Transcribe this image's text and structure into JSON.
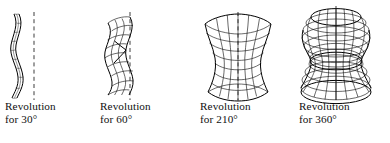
{
  "figure": {
    "kind": "surface-of-revolution-sequence",
    "background": "#ffffff",
    "ink": "#000000",
    "width": 390,
    "height": 143
  },
  "panels": [
    {
      "id": "rev-30",
      "angle_deg": 30,
      "caption_line1": "Revolution",
      "caption_line2": "for 30°",
      "axis": {
        "style": "dashed",
        "visible": true
      },
      "surface": {
        "style": "thin-ribbon",
        "mesh_rings": 9,
        "mesh_meridians": 3
      }
    },
    {
      "id": "rev-60",
      "angle_deg": 60,
      "caption_line1": "Revolution",
      "caption_line2": "for 60°",
      "axis": {
        "style": "dashed",
        "visible": true
      },
      "surface": {
        "style": "narrow-band",
        "mesh_rings": 9,
        "mesh_meridians": 5
      }
    },
    {
      "id": "rev-210",
      "angle_deg": 210,
      "caption_line1": "Revolution",
      "caption_line2": "for 210°",
      "axis": {
        "style": "dashed",
        "visible": true
      },
      "surface": {
        "style": "open-vase",
        "mesh_rings": 9,
        "mesh_meridians": 7
      }
    },
    {
      "id": "rev-360",
      "angle_deg": 360,
      "caption_line1": "Revolution",
      "caption_line2": "for 360°",
      "axis": {
        "style": "solid",
        "visible": true
      },
      "surface": {
        "style": "closed-solid",
        "mesh_rings": 9,
        "mesh_meridians": 12
      }
    }
  ],
  "profile_curve": {
    "description": "Concave vase profile: wide at bottom, pinched at middle, flaring at top",
    "radius_samples": [
      1.0,
      0.84,
      0.63,
      0.45,
      0.36,
      0.38,
      0.52,
      0.72,
      0.92,
      1.0
    ],
    "y_top": 12,
    "y_bottom": 100
  }
}
